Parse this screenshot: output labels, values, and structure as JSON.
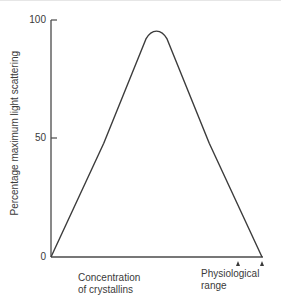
{
  "chart_data": {
    "type": "line",
    "title": "",
    "xlabel": "Concentration of crystallins",
    "ylabel": "Percentage maximum light scattering",
    "ylim": [
      0,
      100
    ],
    "xlim": [
      0,
      1
    ],
    "grid": false,
    "legend": null,
    "yticks": [
      0,
      50,
      100
    ],
    "ytick_labels": [
      "0",
      "50",
      "100"
    ],
    "x": [
      0.0,
      0.25,
      0.45,
      0.5,
      0.55,
      0.75,
      1.0
    ],
    "series": [
      {
        "name": "Light scattering",
        "values": [
          0,
          48,
          92,
          96,
          92,
          48,
          0
        ]
      }
    ],
    "annotations": [
      {
        "text": "Physiological range",
        "type": "arrow-markers",
        "x_range": [
          0.89,
          1.0
        ]
      }
    ]
  },
  "axis": {
    "y_ticks": [
      "100",
      "50",
      "0"
    ],
    "y_title": "Percentage maximum light scattering",
    "x_label_line1": "Concentration",
    "x_label_line2": "of crystallins",
    "range_label_line1": "Physiological",
    "range_label_line2": "range"
  },
  "colors": {
    "line": "#3c3c3c",
    "axis": "#4a4a4a",
    "text": "#3a3a3a"
  }
}
